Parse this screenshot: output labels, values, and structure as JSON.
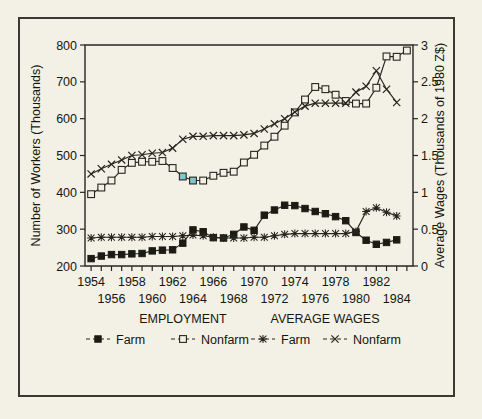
{
  "figure": {
    "background_color": "#f3f1e6",
    "frame_color": "#3a3a32",
    "ink_color": "#26261e",
    "highlight_color": "#7fc6cf"
  },
  "chart_data": {
    "type": "line",
    "title": "",
    "xlabel": "",
    "ylabel": "Number of Workers (Thousands)",
    "y2label": "Average Wages (Thousands of 1980 Z$)",
    "grid": false,
    "legend_position": "bottom",
    "x": [
      1954,
      1955,
      1956,
      1957,
      1958,
      1959,
      1960,
      1961,
      1962,
      1963,
      1964,
      1965,
      1966,
      1967,
      1968,
      1969,
      1970,
      1971,
      1972,
      1973,
      1974,
      1975,
      1976,
      1977,
      1978,
      1979,
      1980,
      1981,
      1982,
      1983,
      1984,
      1985
    ],
    "xlim": [
      1953.4,
      1985.6
    ],
    "xtick_values": [
      1954,
      1955,
      1956,
      1957,
      1958,
      1959,
      1960,
      1961,
      1962,
      1963,
      1964,
      1965,
      1966,
      1967,
      1968,
      1969,
      1970,
      1971,
      1972,
      1973,
      1974,
      1975,
      1976,
      1977,
      1978,
      1979,
      1980,
      1981,
      1982,
      1983,
      1984,
      1985
    ],
    "xtick_labels_row1": [
      "1954",
      "1958",
      "1962",
      "1966",
      "1970",
      "1974",
      "1978",
      "1982"
    ],
    "xtick_labels_row2": [
      "1956",
      "1960",
      "1964",
      "1968",
      "1972",
      "1976",
      "1980",
      "1984"
    ],
    "ylim": [
      200,
      800
    ],
    "ytick_labels": [
      "200",
      "300",
      "400",
      "500",
      "600",
      "700",
      "800"
    ],
    "ytick_values": [
      200,
      300,
      400,
      500,
      600,
      700,
      800
    ],
    "y2lim": [
      0,
      3
    ],
    "y2tick_labels": [
      "0",
      "0.5",
      "1",
      "1.5",
      "2",
      "2.5",
      "3"
    ],
    "y2tick_values": [
      0,
      0.5,
      1,
      1.5,
      2,
      2.5,
      3
    ],
    "series": [
      {
        "name": "Farm",
        "group": "EMPLOYMENT",
        "axis": "left",
        "marker": "filled-square",
        "values": [
          220,
          227,
          231,
          231,
          233,
          234,
          241,
          243,
          244,
          262,
          298,
          293,
          277,
          276,
          286,
          306,
          297,
          338,
          352,
          365,
          364,
          356,
          348,
          342,
          334,
          323,
          291,
          270,
          259,
          264,
          271,
          null
        ]
      },
      {
        "name": "Nonfarm",
        "group": "EMPLOYMENT",
        "axis": "left",
        "marker": "open-square",
        "values": [
          395,
          413,
          432,
          461,
          480,
          483,
          483,
          485,
          466,
          443,
          432,
          432,
          445,
          453,
          456,
          481,
          502,
          527,
          551,
          581,
          617,
          652,
          686,
          680,
          665,
          648,
          641,
          641,
          684,
          769,
          768,
          785
        ],
        "highlight_indices": [
          9,
          10
        ]
      },
      {
        "name": "Farm",
        "group": "AVERAGE WAGES",
        "axis": "right",
        "marker": "star",
        "values": [
          0.38,
          0.39,
          0.39,
          0.39,
          0.39,
          0.39,
          0.4,
          0.4,
          0.4,
          0.41,
          0.42,
          0.41,
          0.39,
          0.38,
          0.38,
          0.38,
          0.39,
          0.39,
          0.41,
          0.43,
          0.44,
          0.44,
          0.44,
          0.44,
          0.44,
          0.44,
          0.47,
          0.74,
          0.79,
          0.73,
          0.68,
          null
        ]
      },
      {
        "name": "Nonfarm",
        "group": "AVERAGE WAGES",
        "axis": "right",
        "marker": "x",
        "values": [
          1.25,
          1.32,
          1.38,
          1.44,
          1.5,
          1.51,
          1.53,
          1.54,
          1.6,
          1.72,
          1.76,
          1.76,
          1.77,
          1.77,
          1.77,
          1.78,
          1.8,
          1.86,
          1.93,
          2.0,
          2.09,
          2.17,
          2.21,
          2.21,
          2.21,
          2.21,
          2.36,
          2.44,
          2.65,
          2.4,
          2.22,
          null
        ]
      }
    ]
  },
  "legend": {
    "group_employment": "EMPLOYMENT",
    "group_wages": "AVERAGE WAGES",
    "items": [
      {
        "label": "Farm",
        "marker": "filled-square",
        "group": "EMPLOYMENT"
      },
      {
        "label": "Nonfarm",
        "marker": "open-square",
        "group": "EMPLOYMENT"
      },
      {
        "label": "Farm",
        "marker": "star",
        "group": "AVERAGE WAGES"
      },
      {
        "label": "Nonfarm",
        "marker": "x",
        "group": "AVERAGE WAGES"
      }
    ]
  }
}
